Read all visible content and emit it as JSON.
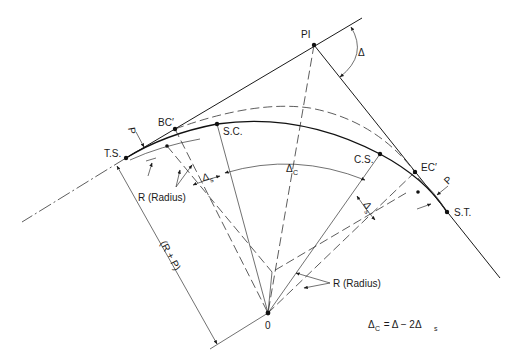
{
  "figure": {
    "points": {
      "pi": "PI",
      "ts": "T.S.",
      "bc": "BC′",
      "sc": "S.C.",
      "cs": "C.S.",
      "ec": "EC′",
      "st": "S.T.",
      "center": "0"
    },
    "angles": {
      "delta": "Δ",
      "delta_c": "Δ",
      "delta_c_sub": "C",
      "delta_s": "Δ",
      "delta_s_sub": "s"
    },
    "dimensions": {
      "p_left": "P",
      "p_right": "P",
      "radius_left": "R (Radius)",
      "radius_right": "R (Radius)",
      "r_plus_p": "(R + P)"
    },
    "formula": {
      "lhs": "Δ",
      "lhs_sub": "C",
      "rhs": " = Δ − 2Δ",
      "rhs_sub": "s"
    }
  }
}
